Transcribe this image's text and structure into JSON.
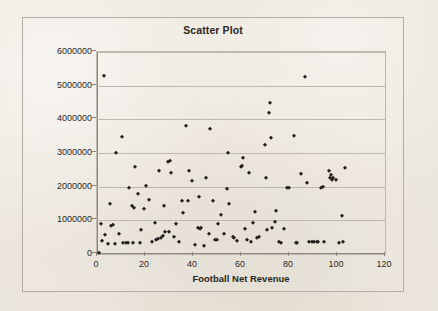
{
  "chart_data": {
    "type": "scatter",
    "title": "Scatter Plot",
    "xlabel": "Football Net Revenue",
    "ylabel": "Head Coach School Pay",
    "xlim": [
      0,
      120
    ],
    "ylim": [
      0,
      6000000
    ],
    "xticks": [
      0,
      20,
      40,
      60,
      80,
      100,
      120
    ],
    "yticks": [
      0,
      1000000,
      2000000,
      3000000,
      4000000,
      5000000,
      6000000
    ],
    "xtick_labels": [
      "0",
      "20",
      "40",
      "60",
      "80",
      "100",
      "120"
    ],
    "ytick_labels": [
      "0",
      "1000000",
      "2000000",
      "3000000",
      "4000000",
      "5000000",
      "6000000"
    ],
    "grid": "horizontal",
    "legend": "none",
    "marker": "diamond",
    "marker_color": "#24211e",
    "points": [
      [
        1.0,
        30000
      ],
      [
        1.5,
        880000
      ],
      [
        2.0,
        380000
      ],
      [
        3.0,
        5300000
      ],
      [
        3.5,
        560000
      ],
      [
        4.5,
        300000
      ],
      [
        5.5,
        1490000
      ],
      [
        6.0,
        840000
      ],
      [
        6.5,
        850000
      ],
      [
        7.5,
        300000
      ],
      [
        8.0,
        2990000
      ],
      [
        9.0,
        600000
      ],
      [
        10.5,
        3480000
      ],
      [
        11.0,
        340000
      ],
      [
        12.0,
        330000
      ],
      [
        13.0,
        340000
      ],
      [
        13.5,
        1950000
      ],
      [
        14.5,
        1430000
      ],
      [
        15.0,
        330000
      ],
      [
        15.5,
        1380000
      ],
      [
        16.0,
        2590000
      ],
      [
        17.0,
        1770000
      ],
      [
        18.0,
        330000
      ],
      [
        18.5,
        720000
      ],
      [
        19.5,
        1340000
      ],
      [
        20.5,
        2030000
      ],
      [
        21.5,
        1600000
      ],
      [
        23.0,
        350000
      ],
      [
        24.0,
        930000
      ],
      [
        24.5,
        430000
      ],
      [
        25.5,
        450000
      ],
      [
        26.0,
        2460000
      ],
      [
        26.5,
        470000
      ],
      [
        27.5,
        520000
      ],
      [
        28.0,
        1430000
      ],
      [
        28.5,
        660000
      ],
      [
        29.5,
        2730000
      ],
      [
        30.0,
        640000
      ],
      [
        30.5,
        2770000
      ],
      [
        31.0,
        2410000
      ],
      [
        32.0,
        510000
      ],
      [
        33.0,
        880000
      ],
      [
        34.0,
        350000
      ],
      [
        35.5,
        1570000
      ],
      [
        36.0,
        1230000
      ],
      [
        37.0,
        3800000
      ],
      [
        38.0,
        1570000
      ],
      [
        38.5,
        2460000
      ],
      [
        39.5,
        2180000
      ],
      [
        41.0,
        280000
      ],
      [
        42.0,
        770000
      ],
      [
        42.5,
        1680000
      ],
      [
        43.0,
        730000
      ],
      [
        43.5,
        760000
      ],
      [
        44.5,
        240000
      ],
      [
        45.5,
        2270000
      ],
      [
        46.5,
        600000
      ],
      [
        47.0,
        3720000
      ],
      [
        48.5,
        1570000
      ],
      [
        49.0,
        420000
      ],
      [
        50.0,
        430000
      ],
      [
        50.5,
        880000
      ],
      [
        51.5,
        1160000
      ],
      [
        53.0,
        580000
      ],
      [
        54.0,
        1920000
      ],
      [
        54.5,
        3010000
      ],
      [
        55.0,
        1480000
      ],
      [
        56.5,
        500000
      ],
      [
        57.0,
        480000
      ],
      [
        58.5,
        380000
      ],
      [
        60.0,
        2580000
      ],
      [
        60.5,
        2610000
      ],
      [
        61.0,
        2850000
      ],
      [
        61.5,
        740000
      ],
      [
        62.5,
        430000
      ],
      [
        63.5,
        2410000
      ],
      [
        64.0,
        370000
      ],
      [
        65.0,
        910000
      ],
      [
        66.0,
        1250000
      ],
      [
        66.5,
        480000
      ],
      [
        67.5,
        500000
      ],
      [
        70.0,
        3240000
      ],
      [
        70.5,
        2270000
      ],
      [
        71.0,
        720000
      ],
      [
        71.5,
        4200000
      ],
      [
        72.0,
        4500000
      ],
      [
        72.5,
        3460000
      ],
      [
        73.0,
        760000
      ],
      [
        74.0,
        940000
      ],
      [
        74.5,
        1290000
      ],
      [
        76.0,
        360000
      ],
      [
        76.5,
        340000
      ],
      [
        78.0,
        740000
      ],
      [
        79.0,
        1960000
      ],
      [
        80.0,
        1960000
      ],
      [
        82.0,
        3500000
      ],
      [
        83.0,
        340000
      ],
      [
        83.5,
        340000
      ],
      [
        85.0,
        2390000
      ],
      [
        86.5,
        5270000
      ],
      [
        87.5,
        2120000
      ],
      [
        88.5,
        350000
      ],
      [
        89.5,
        360000
      ],
      [
        90.5,
        360000
      ],
      [
        91.5,
        370000
      ],
      [
        92.0,
        370000
      ],
      [
        93.5,
        1950000
      ],
      [
        94.0,
        1990000
      ],
      [
        94.5,
        360000
      ],
      [
        96.5,
        2460000
      ],
      [
        97.0,
        2270000
      ],
      [
        97.5,
        2360000
      ],
      [
        98.0,
        2210000
      ],
      [
        98.5,
        2250000
      ],
      [
        99.5,
        2210000
      ],
      [
        101.0,
        340000
      ],
      [
        102.0,
        1140000
      ],
      [
        102.5,
        350000
      ],
      [
        103.5,
        2540000
      ]
    ]
  }
}
